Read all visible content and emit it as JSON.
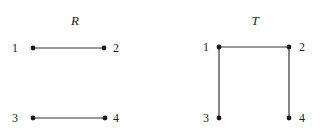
{
  "figure": {
    "background_color": "#ffffff",
    "ink_color": "#1a1a1a",
    "edge_color": "#333333",
    "width": 319,
    "height": 135,
    "graphs": [
      {
        "id": "graph-r",
        "title": "R",
        "title_x": 75,
        "title_y": 14,
        "vertices": [
          {
            "id": "r-1",
            "label": "1",
            "x": 33,
            "y": 48,
            "label_x": 4,
            "label_y": 42,
            "label_side": "left"
          },
          {
            "id": "r-2",
            "label": "2",
            "x": 104,
            "y": 48,
            "label_x": 113,
            "label_y": 42,
            "label_side": "right"
          },
          {
            "id": "r-3",
            "label": "3",
            "x": 33,
            "y": 118,
            "label_x": 4,
            "label_y": 112,
            "label_side": "left"
          },
          {
            "id": "r-4",
            "label": "4",
            "x": 105,
            "y": 118,
            "label_x": 113,
            "label_y": 112,
            "label_side": "right"
          }
        ],
        "edges": [
          {
            "id": "r-edge-1-2",
            "from": "r-1",
            "to": "r-2",
            "x1": 33,
            "y1": 48,
            "x2": 104,
            "y2": 48
          },
          {
            "id": "r-edge-3-4",
            "from": "r-3",
            "to": "r-4",
            "x1": 33,
            "y1": 118,
            "x2": 105,
            "y2": 118
          }
        ]
      },
      {
        "id": "graph-t",
        "title": "T",
        "title_x": 255,
        "title_y": 14,
        "vertices": [
          {
            "id": "t-1",
            "label": "1",
            "x": 219,
            "y": 47,
            "label_x": 195,
            "label_y": 41,
            "label_side": "left"
          },
          {
            "id": "t-2",
            "label": "2",
            "x": 289,
            "y": 47,
            "label_x": 299,
            "label_y": 41,
            "label_side": "right"
          },
          {
            "id": "t-3",
            "label": "3",
            "x": 219,
            "y": 118,
            "label_x": 195,
            "label_y": 112,
            "label_side": "left"
          },
          {
            "id": "t-4",
            "label": "4",
            "x": 289,
            "y": 118,
            "label_x": 299,
            "label_y": 112,
            "label_side": "right"
          }
        ],
        "edges": [
          {
            "id": "t-edge-1-2",
            "from": "t-1",
            "to": "t-2",
            "x1": 219,
            "y1": 47,
            "x2": 289,
            "y2": 47
          },
          {
            "id": "t-edge-1-3",
            "from": "t-1",
            "to": "t-3",
            "x1": 219,
            "y1": 47,
            "x2": 219,
            "y2": 118
          },
          {
            "id": "t-edge-2-4",
            "from": "t-2",
            "to": "t-4",
            "x1": 289,
            "y1": 47,
            "x2": 289,
            "y2": 118
          }
        ]
      }
    ],
    "vertex_radius": 2.4,
    "edge_width": 1.2
  }
}
